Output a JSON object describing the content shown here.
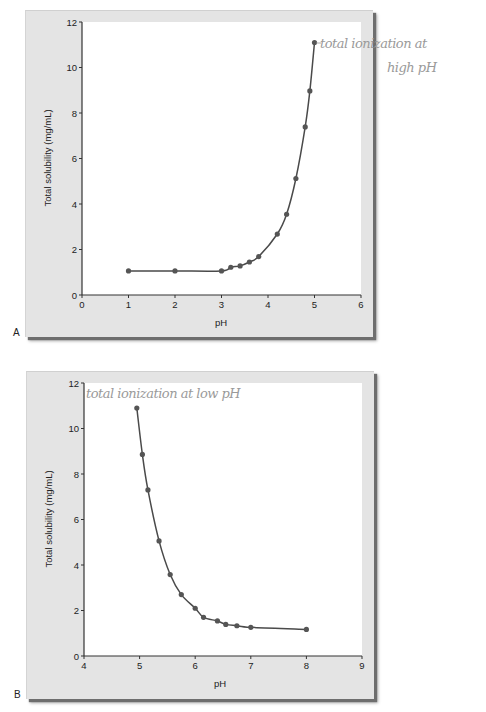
{
  "chart_data": [
    {
      "panel": "A",
      "type": "line",
      "title": "",
      "xlabel": "pH",
      "ylabel": "Total solubility (mg/mL)",
      "xlim": [
        0,
        6
      ],
      "ylim": [
        0,
        12
      ],
      "xticks": [
        0,
        1,
        2,
        3,
        4,
        5,
        6
      ],
      "yticks": [
        0,
        2,
        4,
        6,
        8,
        10,
        12
      ],
      "grid": false,
      "markers": true,
      "x": [
        1.0,
        2.0,
        3.0,
        3.2,
        3.4,
        3.6,
        3.8,
        4.2,
        4.4,
        4.6,
        4.8,
        4.9,
        5.0
      ],
      "y": [
        1.06,
        1.06,
        1.06,
        1.22,
        1.28,
        1.45,
        1.69,
        2.68,
        3.55,
        5.12,
        7.39,
        8.97,
        11.1
      ],
      "annotation": {
        "text_line1": "total ionization at",
        "text_line2": "high pH",
        "anchor_x": 5.0,
        "anchor_y": 11.1
      }
    },
    {
      "panel": "B",
      "type": "line",
      "title": "",
      "xlabel": "pH",
      "ylabel": "Total solubility (mg/mL)",
      "xlim": [
        4,
        9
      ],
      "ylim": [
        0,
        12
      ],
      "xticks": [
        4,
        5,
        6,
        7,
        8,
        9
      ],
      "yticks": [
        0,
        2,
        4,
        6,
        8,
        10,
        12
      ],
      "grid": false,
      "markers": true,
      "x": [
        4.95,
        5.05,
        5.15,
        5.35,
        5.55,
        5.75,
        6.0,
        6.15,
        6.4,
        6.55,
        6.75,
        7.0,
        8.0
      ],
      "y": [
        10.9,
        8.86,
        7.3,
        5.06,
        3.58,
        2.7,
        2.1,
        1.7,
        1.54,
        1.39,
        1.33,
        1.26,
        1.17
      ],
      "annotation": {
        "text_line1": "total ionization at low pH",
        "text_line2": ""
      }
    }
  ],
  "panels": {
    "a": {
      "letter": "A",
      "xlabel": "pH",
      "ylabel": "Total solubility (mg/mL)",
      "annotation_line1": "total ionization at",
      "annotation_line2": "high pH"
    },
    "b": {
      "letter": "B",
      "xlabel": "pH",
      "ylabel": "Total solubility (mg/mL)",
      "annotation_line1": "total ionization at low pH"
    }
  },
  "colors": {
    "line": "#4a4a4a",
    "marker": "#555555",
    "frame": "#e4e4e4",
    "plot_bg": "#ffffff",
    "annotation": "#9a9a9a"
  }
}
